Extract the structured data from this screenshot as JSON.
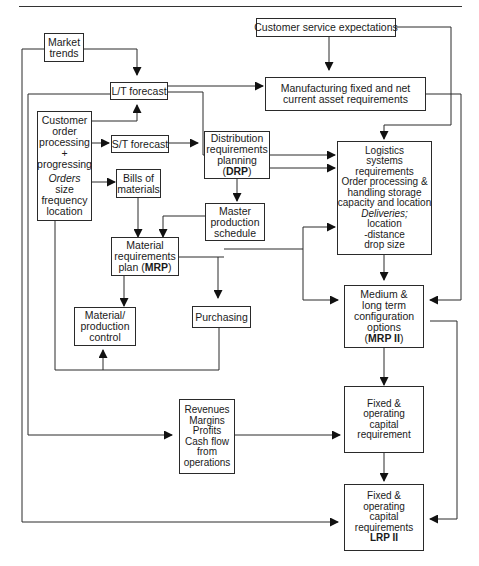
{
  "diagram": {
    "nodes": {
      "market_trends": {
        "lines": [
          "Market",
          "trends"
        ]
      },
      "customer_service": {
        "lines": [
          "Customer service expectations"
        ]
      },
      "lt_forecast": {
        "lines": [
          "L/T forecast"
        ]
      },
      "manufacturing": {
        "lines": [
          "Manufacturing fixed and net",
          "current asset requirements"
        ]
      },
      "customer_order": {
        "lines": [
          "Customer",
          "order",
          "processing",
          "+",
          "progressing"
        ],
        "orders_label": "Orders",
        "orders_lines": [
          "size",
          "frequency",
          "location"
        ]
      },
      "st_forecast": {
        "lines": [
          "S/T forecast"
        ]
      },
      "drp": {
        "lines": [
          "Distribution",
          "requirements",
          "planning"
        ],
        "abbr_open": "(",
        "abbr": "DRP",
        "abbr_close": ")"
      },
      "bom": {
        "lines": [
          "Bills of",
          "materials"
        ]
      },
      "mps": {
        "lines": [
          "Master",
          "production",
          "schedule"
        ]
      },
      "logistics": {
        "lines": [
          "Logistics",
          "systems",
          "requirements",
          "Order processing &",
          "handling storage",
          "capacity and location"
        ],
        "deliveries_label": "Deliveries;",
        "delivery_lines": [
          "location",
          "-distance",
          "drop size"
        ]
      },
      "mrp": {
        "lines": [
          "Material",
          "requirements"
        ],
        "last_prefix": "plan (",
        "abbr": "MRP",
        "abbr_close": ")"
      },
      "mpc": {
        "lines": [
          "Material/",
          "production",
          "control"
        ]
      },
      "purchasing": {
        "lines": [
          "Purchasing"
        ]
      },
      "mrp2": {
        "lines": [
          "Medium &",
          "long term",
          "configuration",
          "options"
        ],
        "abbr_open": "(",
        "abbr": "MRP II",
        "abbr_close": ")"
      },
      "revenues": {
        "lines": [
          "Revenues",
          "Margins",
          "Profits",
          "Cash flow",
          "from",
          "operations"
        ]
      },
      "capital_req": {
        "lines": [
          "Fixed &",
          "operating",
          "capital",
          "requirement"
        ]
      },
      "lrp2": {
        "lines": [
          "Fixed &",
          "operating",
          "capital",
          "requirements"
        ],
        "abbr": "LRP II"
      }
    },
    "edges": [
      [
        "market_trends",
        "lt_forecast"
      ],
      [
        "market_trends",
        "lrp2"
      ],
      [
        "customer_service",
        "manufacturing"
      ],
      [
        "customer_service",
        "logistics"
      ],
      [
        "lt_forecast",
        "manufacturing"
      ],
      [
        "lt_forecast",
        "logistics"
      ],
      [
        "lt_forecast",
        "revenues"
      ],
      [
        "customer_order",
        "lt_forecast"
      ],
      [
        "customer_order",
        "st_forecast"
      ],
      [
        "customer_order",
        "bom"
      ],
      [
        "customer_order",
        "mpc"
      ],
      [
        "st_forecast",
        "drp"
      ],
      [
        "drp",
        "logistics"
      ],
      [
        "drp",
        "mps"
      ],
      [
        "bom",
        "mrp"
      ],
      [
        "mps",
        "mrp"
      ],
      [
        "mrp",
        "logistics"
      ],
      [
        "mrp",
        "mrp2"
      ],
      [
        "mrp",
        "mpc"
      ],
      [
        "mrp",
        "purchasing"
      ],
      [
        "purchasing",
        "mpc"
      ],
      [
        "manufacturing",
        "mrp2"
      ],
      [
        "logistics",
        "mrp2"
      ],
      [
        "mrp2",
        "capital_req"
      ],
      [
        "mrp2",
        "lrp2"
      ],
      [
        "revenues",
        "capital_req"
      ],
      [
        "capital_req",
        "lrp2"
      ]
    ]
  }
}
